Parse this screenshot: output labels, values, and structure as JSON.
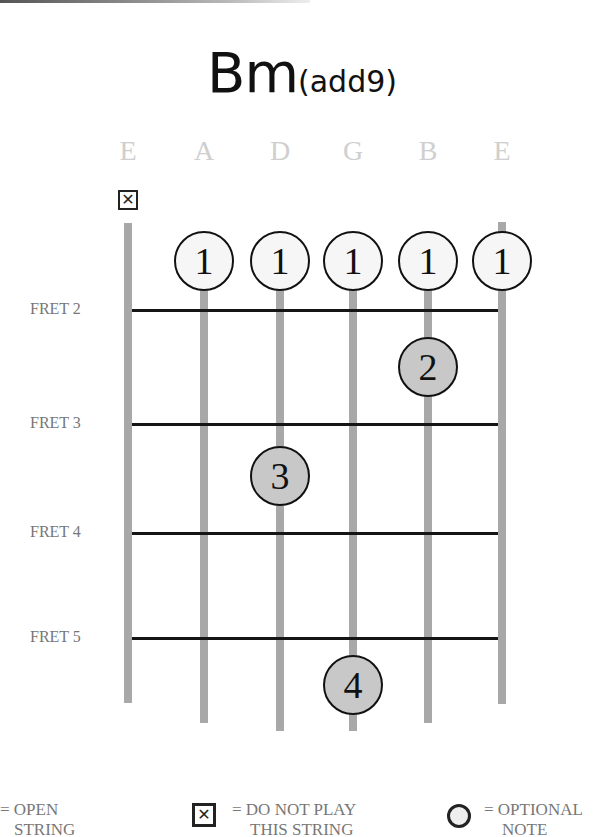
{
  "title": {
    "main": "Bm",
    "sub": "(add9)"
  },
  "strings": [
    {
      "name": "E",
      "x": 128,
      "top": 223,
      "bottom": 703
    },
    {
      "name": "A",
      "x": 204,
      "top": 240,
      "bottom": 723
    },
    {
      "name": "D",
      "x": 280,
      "top": 240,
      "bottom": 731
    },
    {
      "name": "G",
      "x": 353,
      "top": 240,
      "bottom": 731
    },
    {
      "name": "B",
      "x": 428,
      "top": 240,
      "bottom": 723
    },
    {
      "name": "E",
      "x": 502,
      "top": 222,
      "bottom": 704
    }
  ],
  "frets": [
    {
      "label": "FRET 2",
      "y": 310
    },
    {
      "label": "FRET 3",
      "y": 424
    },
    {
      "label": "FRET 4",
      "y": 533
    },
    {
      "label": "FRET 5",
      "y": 638
    }
  ],
  "muted_string": {
    "index": 0,
    "symbol": "✕"
  },
  "fingers": [
    {
      "string": 1,
      "finger": "1",
      "style": "open",
      "y": 261
    },
    {
      "string": 2,
      "finger": "1",
      "style": "open",
      "y": 261
    },
    {
      "string": 3,
      "finger": "1",
      "style": "open",
      "y": 261
    },
    {
      "string": 4,
      "finger": "1",
      "style": "open",
      "y": 261
    },
    {
      "string": 5,
      "finger": "1",
      "style": "open",
      "y": 261
    },
    {
      "string": 4,
      "finger": "2",
      "style": "fill",
      "y": 367
    },
    {
      "string": 2,
      "finger": "3",
      "style": "fill",
      "y": 476
    },
    {
      "string": 3,
      "finger": "4",
      "style": "fill",
      "y": 685
    }
  ],
  "legend": {
    "open": {
      "line1": "= OPEN",
      "line2": "STRING"
    },
    "muted": {
      "symbol": "✕",
      "line1": "= DO NOT PLAY",
      "line2": "THIS STRING"
    },
    "optional": {
      "line1": "= OPTIONAL",
      "line2": "NOTE"
    }
  },
  "colors": {
    "string": "#a8a8a8",
    "fret": "#151515",
    "filled_dot": "#c8c8c8",
    "string_names": "#cfcfcf"
  }
}
